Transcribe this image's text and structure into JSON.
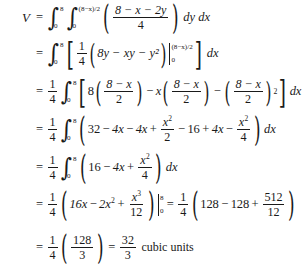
{
  "document": {
    "type": "math-derivation",
    "subject": "double integral volume computation",
    "result_value": "32/3",
    "result_units": "cubic units"
  },
  "symbols": {
    "V": "V",
    "equals": "=",
    "plus": "+",
    "minus": "−",
    "dx": "dx",
    "dy": "dy",
    "dydx": "dy dx",
    "integral": "∫"
  },
  "lines": [
    {
      "id": "line-1",
      "lhs": "V",
      "relation": "=",
      "text": "V = ∫₀⁸ ∫₀^((8−x)/2) ((8 − x − 2y)/4) dy dx",
      "outer_integral": {
        "lower": "0",
        "upper": "8"
      },
      "inner_integral": {
        "lower": "0",
        "upper": "(8−x)/2"
      },
      "integrand_numerator": "8 − x − 2y",
      "integrand_denominator": "4",
      "differentials": "dy dx"
    },
    {
      "id": "line-2",
      "lhs": "",
      "relation": "=",
      "text": "= ∫₀⁸ [ (1/4)(8y − xy − y²) |₀^((8−x)/2) ] dx",
      "integral": {
        "lower": "0",
        "upper": "8"
      },
      "coefficient_numerator": "1",
      "coefficient_denominator": "4",
      "expression": "8y − xy − y²",
      "eval_lower": "0",
      "eval_upper": "(8−x)/2",
      "differential": "dx"
    },
    {
      "id": "line-3",
      "lhs": "",
      "relation": "=",
      "text": "= (1/4) ∫₀⁸ [ 8((8−x)/2) − x((8−x)/2) − ((8−x)/2)² ] dx",
      "coefficient_numerator": "1",
      "coefficient_denominator": "4",
      "integral": {
        "lower": "0",
        "upper": "8"
      },
      "term_1_coefficient": "8",
      "term_1_fraction": {
        "numerator": "8 − x",
        "denominator": "2"
      },
      "term_2_coefficient": "x",
      "term_2_fraction": {
        "numerator": "8 − x",
        "denominator": "2"
      },
      "term_3_fraction": {
        "numerator": "8 − x",
        "denominator": "2"
      },
      "term_3_power": "2",
      "differential": "dx"
    },
    {
      "id": "line-4",
      "lhs": "",
      "relation": "=",
      "text": "= (1/4) ∫₀⁸ (32 − 4x − 4x + x²/2 − 16 + 4x − x²/4) dx",
      "coefficient_numerator": "1",
      "coefficient_denominator": "4",
      "integral": {
        "lower": "0",
        "upper": "8"
      },
      "terms": [
        "32",
        "− 4x",
        "− 4x",
        "+ x²/2",
        "− 16",
        "+ 4x",
        "− x²/4"
      ],
      "differential": "dx"
    },
    {
      "id": "line-5",
      "lhs": "",
      "relation": "=",
      "text": "= (1/4) ∫₀⁸ (16 − 4x + x²/4) dx",
      "coefficient_numerator": "1",
      "coefficient_denominator": "4",
      "integral": {
        "lower": "0",
        "upper": "8"
      },
      "terms": [
        "16",
        "− 4x",
        "+ x²/4"
      ],
      "differential": "dx"
    },
    {
      "id": "line-6",
      "lhs": "",
      "relation": "=",
      "text": "= (1/4)(16x − 2x² + x³/12) |₀⁸ = (1/4)(128 − 128 + 512/12)",
      "coefficient_numerator": "1",
      "coefficient_denominator": "4",
      "antiderivative": "16x − 2x² + x³/12",
      "eval_lower": "0",
      "eval_upper": "8",
      "second_coefficient_numerator": "1",
      "second_coefficient_denominator": "4",
      "evaluated_terms": [
        "128",
        "− 128",
        "+ 512/12"
      ]
    },
    {
      "id": "line-7",
      "lhs": "",
      "relation": "=",
      "text": "= (1/4)(128/3) = 32/3 cubic units",
      "coefficient_numerator": "1",
      "coefficient_denominator": "4",
      "inner_numerator": "128",
      "inner_denominator": "3",
      "result_numerator": "32",
      "result_denominator": "3",
      "units_label": "cubic units"
    }
  ],
  "numbers": {
    "n0": "0",
    "n2": "2",
    "n3": "3",
    "n4": "4",
    "n8": "8",
    "n12": "12",
    "n16": "16",
    "n32": "32",
    "n128": "128",
    "n512": "512"
  },
  "vars": {
    "x": "x",
    "y": "y",
    "xy": "xy",
    "eight_minus_x": "8 − x",
    "limit_expr": "(8−x)/2"
  },
  "coefficients": {
    "c4x": "4x",
    "c8y": "8y",
    "c16x": "16x",
    "c2x": "2x"
  },
  "colors": {
    "background": "#ffffff",
    "text": "#1a1a1a"
  }
}
